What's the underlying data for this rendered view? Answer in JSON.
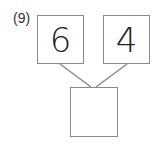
{
  "problem": {
    "label": "(9)",
    "left_number": "6",
    "right_number": "4",
    "answer": ""
  },
  "colors": {
    "box_border": "#8a8a8a",
    "line": "#8a8a8a",
    "text": "#222222"
  }
}
